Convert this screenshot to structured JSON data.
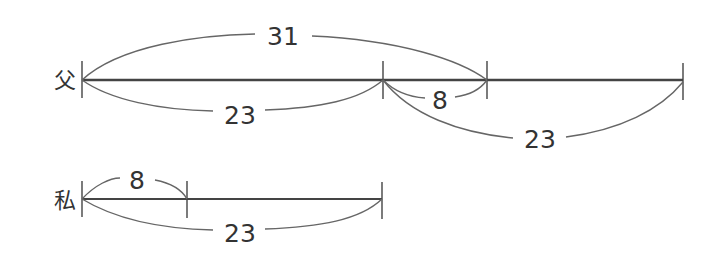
{
  "diagram": {
    "type": "line-segment age diagram",
    "rows": [
      {
        "name": "父",
        "braces": [
          {
            "label": "31",
            "side": "top",
            "span": "father start to father mark 31"
          },
          {
            "label": "23",
            "side": "bottom",
            "span": "father start to 23"
          },
          {
            "label": "8",
            "side": "bottom",
            "span": "23 to 31"
          },
          {
            "label": "23",
            "side": "bottom",
            "span": "23 to father end"
          }
        ]
      },
      {
        "name": "私",
        "braces": [
          {
            "label": "8",
            "side": "top",
            "span": "me start to 8"
          },
          {
            "label": "23",
            "side": "bottom",
            "span": "me start to me end"
          }
        ]
      }
    ]
  },
  "labels": {
    "father": "父",
    "me": "私",
    "father_top_31": "31",
    "father_bottom_23a": "23",
    "father_bottom_8": "8",
    "father_bottom_23b": "23",
    "me_top_8": "8",
    "me_bottom_23": "23"
  }
}
